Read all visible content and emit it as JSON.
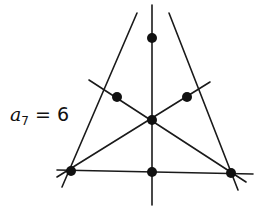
{
  "label": {
    "variable": "a",
    "subscript": "7",
    "equals": "=",
    "value": "6"
  },
  "figure": {
    "stroke_color": "#1a1a1a",
    "point_color": "#111111",
    "points": [
      {
        "name": "top-vertex",
        "x": 152,
        "y": 38
      },
      {
        "name": "bottom-left-vertex",
        "x": 71,
        "y": 171
      },
      {
        "name": "bottom-right-vertex",
        "x": 231,
        "y": 173
      },
      {
        "name": "left-midpoint",
        "x": 117,
        "y": 97
      },
      {
        "name": "right-midpoint",
        "x": 187,
        "y": 97
      },
      {
        "name": "centroid",
        "x": 152,
        "y": 120
      },
      {
        "name": "bottom-midpoint",
        "x": 152,
        "y": 172
      }
    ],
    "lines": [
      {
        "name": "left-side",
        "x1": 137,
        "y1": 13,
        "x2": 62,
        "y2": 187
      },
      {
        "name": "right-side",
        "x1": 169,
        "y1": 13,
        "x2": 238,
        "y2": 190
      },
      {
        "name": "base",
        "x1": 57,
        "y1": 170,
        "x2": 253,
        "y2": 174
      },
      {
        "name": "vertical-median",
        "x1": 152,
        "y1": 5,
        "x2": 152,
        "y2": 205
      },
      {
        "name": "median-from-bottom-left",
        "x1": 57,
        "y1": 177,
        "x2": 210,
        "y2": 82
      },
      {
        "name": "median-from-bottom-right",
        "x1": 246,
        "y1": 182,
        "x2": 89,
        "y2": 80
      }
    ]
  }
}
